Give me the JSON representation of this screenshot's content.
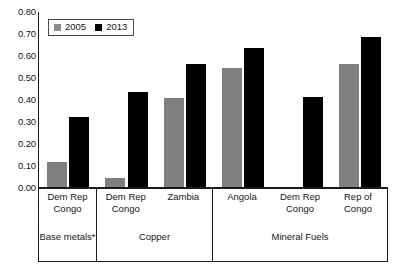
{
  "chart_data": {
    "type": "bar",
    "title": "",
    "subtitle": "",
    "xlabel": "",
    "ylabel": "",
    "ylim": [
      0.0,
      0.8
    ],
    "y_ticks": [
      "0.00",
      "0.10",
      "0.20",
      "0.30",
      "0.40",
      "0.50",
      "0.60",
      "0.70",
      "0.80"
    ],
    "y_tick_values": [
      0.0,
      0.1,
      0.2,
      0.3,
      0.4,
      0.5,
      0.6,
      0.7,
      0.8
    ],
    "grid": false,
    "legend_position": "top-left",
    "legend": [
      "2005",
      "2013"
    ],
    "series": [
      {
        "name": "2005",
        "color": "#808080",
        "values": [
          0.12,
          0.045,
          0.41,
          0.545,
          null,
          0.565
        ]
      },
      {
        "name": "2013",
        "color": "#000000",
        "values": [
          0.325,
          0.435,
          0.565,
          0.635,
          0.415,
          0.685
        ]
      }
    ],
    "categories": [
      "Dem Rep Congo",
      "Dem Rep Congo",
      "Zambia",
      "Angola",
      "Dem Rep Congo",
      "Rep of Congo"
    ],
    "groups": [
      {
        "label": "Base metals*",
        "categories": [
          "Dem Rep Congo"
        ]
      },
      {
        "label": "Copper",
        "categories": [
          "Dem Rep Congo",
          "Zambia"
        ]
      },
      {
        "label": "Mineral Fuels",
        "categories": [
          "Angola",
          "Dem Rep Congo",
          "Rep of Congo"
        ]
      }
    ],
    "bars": [
      {
        "group": 0,
        "category": "Dem Rep Congo",
        "series": "2005",
        "value": 0.12
      },
      {
        "group": 0,
        "category": "Dem Rep Congo",
        "series": "2013",
        "value": 0.325
      },
      {
        "group": 1,
        "category": "Dem Rep Congo",
        "series": "2005",
        "value": 0.045
      },
      {
        "group": 1,
        "category": "Dem Rep Congo",
        "series": "2013",
        "value": 0.435
      },
      {
        "group": 1,
        "category": "Zambia",
        "series": "2005",
        "value": 0.41
      },
      {
        "group": 1,
        "category": "Zambia",
        "series": "2013",
        "value": 0.565
      },
      {
        "group": 2,
        "category": "Angola",
        "series": "2005",
        "value": 0.545
      },
      {
        "group": 2,
        "category": "Angola",
        "series": "2013",
        "value": 0.635
      },
      {
        "group": 2,
        "category": "Dem Rep Congo",
        "series": "2013",
        "value": 0.415
      },
      {
        "group": 2,
        "category": "Rep of Congo",
        "series": "2005",
        "value": 0.565
      },
      {
        "group": 2,
        "category": "Rep of Congo",
        "series": "2013",
        "value": 0.685
      }
    ]
  },
  "colors": {
    "series_2005": "#808080",
    "series_2013": "#000000",
    "axis": "#1a1a1a",
    "background": "#ffffff"
  }
}
